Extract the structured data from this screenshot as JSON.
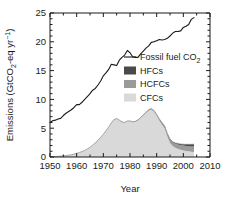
{
  "chart_data": {
    "type": "area",
    "title": "",
    "xlabel": "Year",
    "ylabel": "Emissions (GtCO2-eq yr-1)",
    "ylabel_parts": {
      "prefix": "Emissions (GtCO",
      "sub1": "2",
      "mid": "-eq yr",
      "sup1": "−1",
      "suffix": ")"
    },
    "xlim": [
      1950,
      2010
    ],
    "ylim": [
      0,
      25
    ],
    "xticks": [
      1950,
      1960,
      1970,
      1980,
      1990,
      2000,
      2010
    ],
    "xtick_labels": [
      "1950",
      "1960",
      "1970",
      "1980",
      "1990",
      "2000",
      "2010"
    ],
    "xminor_step": 5,
    "yticks": [
      0,
      5,
      10,
      15,
      20,
      25
    ],
    "ytick_labels": [
      "0",
      "5",
      "10",
      "15",
      "20",
      "25"
    ],
    "yminor_step": 1,
    "grid": false,
    "legend_position": "center-right-inside",
    "colors": {
      "fossil_line": "#1a1a1a",
      "hfcs": "#4a4a4a",
      "hcfcs": "#9a9a9a",
      "cfcs": "#d9d9d9",
      "axis": "#1a1a1a",
      "background": "#ffffff"
    },
    "legend": [
      {
        "label": "Fossil fuel CO2",
        "label_prefix": "Fossil fuel CO",
        "label_sub": "2",
        "type": "line",
        "color": "#1a1a1a"
      },
      {
        "label": "HFCs",
        "type": "patch",
        "color": "#4a4a4a"
      },
      {
        "label": "HCFCs",
        "type": "patch",
        "color": "#9a9a9a"
      },
      {
        "label": "CFCs",
        "type": "patch",
        "color": "#d9d9d9"
      }
    ],
    "x": [
      1950,
      1951,
      1952,
      1953,
      1954,
      1955,
      1956,
      1957,
      1958,
      1959,
      1960,
      1961,
      1962,
      1963,
      1964,
      1965,
      1966,
      1967,
      1968,
      1969,
      1970,
      1971,
      1972,
      1973,
      1974,
      1975,
      1976,
      1977,
      1978,
      1979,
      1980,
      1981,
      1982,
      1983,
      1984,
      1985,
      1986,
      1987,
      1988,
      1989,
      1990,
      1991,
      1992,
      1993,
      1994,
      1995,
      1996,
      1997,
      1998,
      1999,
      2000,
      2001,
      2002,
      2003,
      2004
    ],
    "series": [
      {
        "name": "Fossil fuel CO2",
        "type": "line",
        "values": [
          6.0,
          6.3,
          6.4,
          6.6,
          6.7,
          7.2,
          7.6,
          7.9,
          8.2,
          8.6,
          9.1,
          9.1,
          9.5,
          10.0,
          10.5,
          11.0,
          11.6,
          11.9,
          12.5,
          13.2,
          14.1,
          14.6,
          15.2,
          16.1,
          16.0,
          15.9,
          16.8,
          17.3,
          17.7,
          18.5,
          18.1,
          17.4,
          17.3,
          17.3,
          17.9,
          18.4,
          18.9,
          19.3,
          19.9,
          20.0,
          20.2,
          20.4,
          20.3,
          20.4,
          20.6,
          21.0,
          21.5,
          21.8,
          21.8,
          21.9,
          22.5,
          22.7,
          23.0,
          23.9,
          24.2
        ]
      },
      {
        "name": "CFCs",
        "type": "area",
        "values": [
          0.05,
          0.07,
          0.09,
          0.12,
          0.15,
          0.2,
          0.25,
          0.32,
          0.4,
          0.5,
          0.62,
          0.78,
          0.95,
          1.15,
          1.4,
          1.7,
          2.05,
          2.45,
          2.9,
          3.4,
          3.95,
          4.55,
          5.2,
          5.9,
          6.45,
          6.65,
          6.35,
          6.05,
          5.95,
          6.2,
          6.2,
          6.05,
          6.1,
          6.35,
          6.75,
          7.2,
          7.65,
          8.05,
          8.25,
          7.85,
          7.15,
          6.3,
          5.6,
          4.95,
          3.55,
          2.45,
          1.9,
          1.6,
          1.4,
          1.25,
          1.15,
          1.05,
          0.98,
          0.92,
          0.88
        ]
      },
      {
        "name": "HCFCs",
        "type": "area",
        "values": [
          0.0,
          0.0,
          0.0,
          0.0,
          0.0,
          0.0,
          0.0,
          0.0,
          0.0,
          0.0,
          0.0,
          0.0,
          0.0,
          0.0,
          0.0,
          0.0,
          0.01,
          0.01,
          0.01,
          0.02,
          0.02,
          0.02,
          0.03,
          0.03,
          0.04,
          0.04,
          0.05,
          0.05,
          0.06,
          0.07,
          0.07,
          0.08,
          0.09,
          0.1,
          0.11,
          0.12,
          0.14,
          0.16,
          0.18,
          0.21,
          0.25,
          0.3,
          0.36,
          0.42,
          0.5,
          0.58,
          0.65,
          0.71,
          0.76,
          0.8,
          0.84,
          0.87,
          0.9,
          0.92,
          0.95
        ]
      },
      {
        "name": "HFCs",
        "type": "area",
        "values": [
          0.0,
          0.0,
          0.0,
          0.0,
          0.0,
          0.0,
          0.0,
          0.0,
          0.0,
          0.0,
          0.0,
          0.0,
          0.0,
          0.0,
          0.0,
          0.0,
          0.0,
          0.0,
          0.0,
          0.0,
          0.0,
          0.0,
          0.0,
          0.0,
          0.0,
          0.0,
          0.0,
          0.0,
          0.0,
          0.0,
          0.0,
          0.0,
          0.0,
          0.0,
          0.0,
          0.0,
          0.0,
          0.0,
          0.0,
          0.0,
          0.0,
          0.01,
          0.02,
          0.03,
          0.05,
          0.08,
          0.11,
          0.14,
          0.17,
          0.2,
          0.24,
          0.28,
          0.32,
          0.36,
          0.4
        ]
      }
    ]
  }
}
